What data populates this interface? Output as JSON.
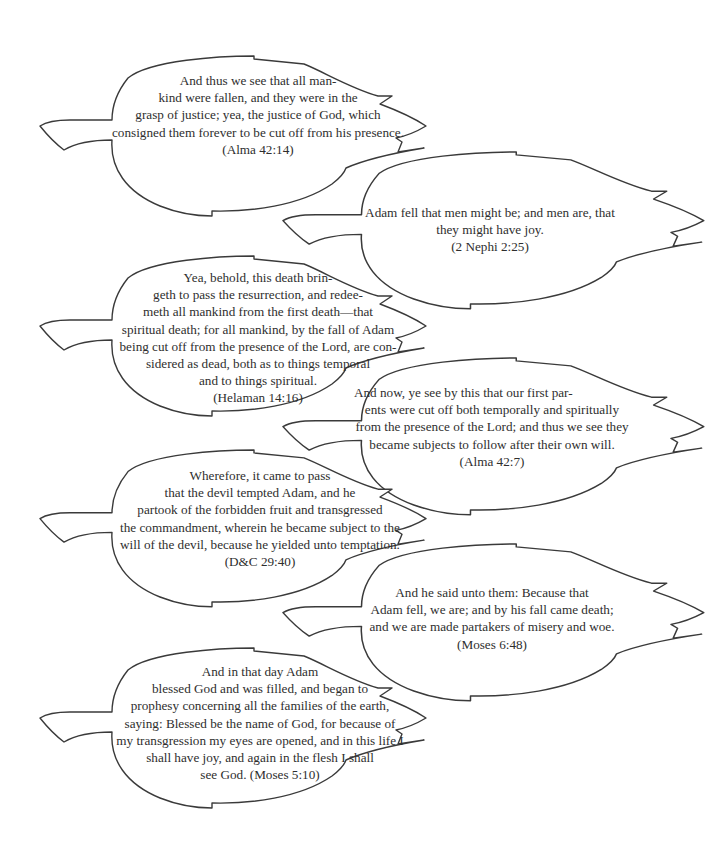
{
  "leaves": [
    {
      "side": "left",
      "lines": [
        "And thus we see that all man-",
        "kind were fallen, and they were in the",
        "grasp of justice; yea, the justice of God, which",
        "consigned them forever to be cut off from his presence.",
        "(Alma 42:14)"
      ],
      "reference": "(Alma 42:14)"
    },
    {
      "side": "right",
      "lines": [
        "Adam fell that men might be; and men are, that",
        "they might have joy.",
        "(2 Nephi 2:25)"
      ],
      "reference": "(2 Nephi 2:25)"
    },
    {
      "side": "left",
      "lines": [
        "Yea, behold, this death brin-",
        "geth to pass the resurrection, and redee-",
        "meth all mankind from the first death—that",
        "spiritual death; for all mankind, by the fall of Adam",
        "being cut off from the presence of the Lord, are con-",
        "sidered as dead, both as to things temporal",
        "and to things spiritual.",
        "(Helaman 14:16)"
      ],
      "reference": "(Helaman 14:16)"
    },
    {
      "side": "right",
      "lines": [
        "And now, ye see by this that our first par-",
        "ents were cut off both temporally and spiritually",
        "from the presence of the Lord; and thus we see they",
        "became subjects to follow after their own will.",
        "(Alma 42:7)"
      ],
      "reference": "(Alma 42:7)"
    },
    {
      "side": "left",
      "lines": [
        "Wherefore, it came to pass",
        "that the devil tempted Adam, and he",
        "partook of the forbidden fruit and transgressed",
        "the commandment, wherein he became subject to the",
        "will of the devil, because he yielded unto temptation.",
        "(D&C 29:40)"
      ],
      "reference": "(D&C 29:40)"
    },
    {
      "side": "right",
      "lines": [
        "And he said unto them: Because that",
        "Adam fell, we are; and by his fall came death;",
        "and we are made partakers of misery and woe.",
        "(Moses 6:48)"
      ],
      "reference": "(Moses 6:48)"
    },
    {
      "side": "left",
      "lines": [
        "And in that day Adam",
        "blessed God and was filled, and began to",
        "prophesy concerning all the families of the earth,",
        "saying: Blessed be the name of God, for because of",
        "my transgression my eyes are opened, and in this life I",
        "shall have joy, and again in the flesh I shall",
        "see God. (Moses 5:10)"
      ],
      "reference": "(Moses 5:10)"
    }
  ],
  "colors": {
    "outline": "#3a3a3a",
    "text": "#2e2e2e",
    "background": "#ffffff"
  }
}
